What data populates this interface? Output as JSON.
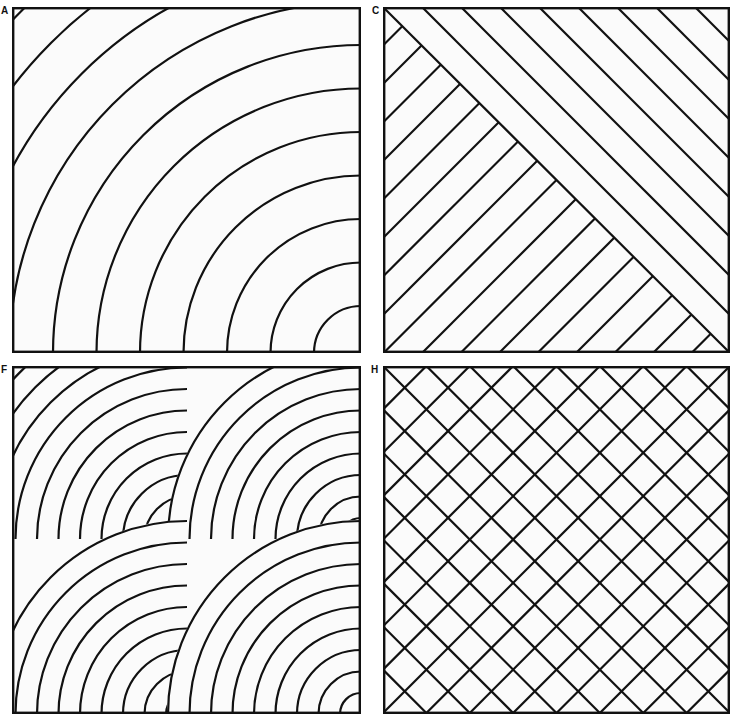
{
  "figure": {
    "panels": [
      {
        "id": "A",
        "label": "A",
        "pattern": "concentric-arcs",
        "description": "Concentric quarter-circle arcs centered on the bottom-right corner",
        "arc_count": 12,
        "stroke_color": "#111111"
      },
      {
        "id": "C",
        "label": "C",
        "pattern": "herringbone-diagonal",
        "description": "Diagonal parallel lines above the main diagonal, perpendicular lines below it",
        "upper_line_count": 8,
        "lower_line_count": 8,
        "stroke_color": "#111111"
      },
      {
        "id": "F",
        "label": "F",
        "pattern": "overlapping-scales",
        "description": "Four overlapping sets of concentric quarter-circle arcs (scale pattern)",
        "arc_sets": 4,
        "arcs_per_set": 9,
        "stroke_color": "#111111"
      },
      {
        "id": "H",
        "label": "H",
        "pattern": "diagonal-crosshatch",
        "description": "Diagonal lattice of crossing lines in both directions",
        "divisions_per_edge": 8,
        "stroke_color": "#111111"
      }
    ],
    "background_color": "#fbfbfb",
    "border_color": "#111111"
  }
}
